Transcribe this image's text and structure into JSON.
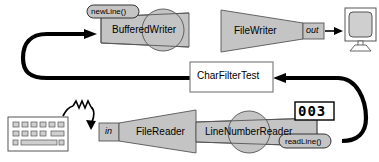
{
  "diagram": {
    "colors": {
      "component_fill": "#c4c4c4",
      "component_stroke": "#555555",
      "box_fill": "#ffffff",
      "box_stroke": "#808080",
      "flow_arrow": "#000000",
      "display_digit": "#000000",
      "device_fill": "#cfcfcf"
    },
    "components": [
      {
        "id": "bufferedwriter",
        "label": "BufferedWriter",
        "shape": "trapezoid-with-circle"
      },
      {
        "id": "filewriter",
        "label": "FileWriter",
        "shape": "funnel-right"
      },
      {
        "id": "filereader",
        "label": "FileReader",
        "shape": "funnel-left"
      },
      {
        "id": "linenumberreader",
        "label": "LineNumberReader",
        "shape": "trapezoid-with-circle"
      }
    ],
    "method_pills": [
      {
        "id": "newline",
        "label": "newLine()"
      },
      {
        "id": "readline",
        "label": "readLine()"
      }
    ],
    "ports": [
      {
        "id": "out",
        "label": "out"
      },
      {
        "id": "in",
        "label": "in"
      }
    ],
    "boxes": [
      {
        "id": "charfiltertest",
        "label": "CharFilterTest"
      }
    ],
    "line_counter": {
      "id": "line-number-display",
      "value": "003",
      "digits": [
        "0",
        "0",
        "3"
      ]
    },
    "devices": [
      {
        "id": "monitor",
        "label": "monitor",
        "icon": "monitor-icon"
      },
      {
        "id": "keyboard",
        "label": "keyboard",
        "icon": "keyboard-icon"
      }
    ],
    "flows": [
      {
        "id": "flow-charfiltertest-to-bufferedwriter",
        "from": "CharFilterTest",
        "to": "BufferedWriter"
      },
      {
        "id": "flow-filewriter-to-monitor",
        "from": "out",
        "to": "monitor"
      },
      {
        "id": "flow-keyboard-to-filereader",
        "from": "keyboard",
        "to": "in"
      },
      {
        "id": "flow-readline-to-charfiltertest",
        "from": "readLine()",
        "to": "CharFilterTest"
      }
    ]
  }
}
